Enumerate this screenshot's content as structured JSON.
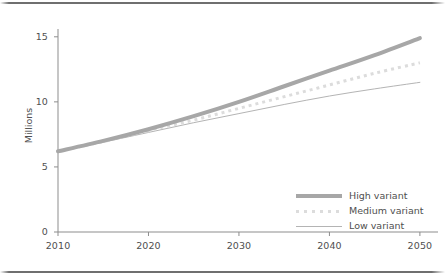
{
  "figure": {
    "background_color": "#ffffff",
    "rule_color": "#6f6f6f",
    "top_rule_name": "top-divider",
    "bottom_rule_name": "bottom-divider"
  },
  "chart_data": {
    "type": "line",
    "title": "",
    "subtitle": "",
    "xlabel": "",
    "ylabel": "Millions",
    "xlim": [
      2010,
      2052
    ],
    "ylim": [
      0,
      15.6
    ],
    "xticks": [
      2010,
      2020,
      2030,
      2040,
      2050
    ],
    "xtick_labels": [
      "2010",
      "2020",
      "2030",
      "2040",
      "2050"
    ],
    "yticks": [
      0,
      5,
      10,
      15
    ],
    "ytick_labels": [
      "0",
      "5",
      "10",
      "15"
    ],
    "grid": false,
    "legend_position": "lower right",
    "x": [
      2010,
      2015,
      2020,
      2025,
      2030,
      2035,
      2040,
      2045,
      2050
    ],
    "series": [
      {
        "name": "High variant",
        "color": "#a7a7a7",
        "style": "solid",
        "width": 4,
        "values": [
          6.2,
          7.0,
          7.9,
          8.9,
          10.0,
          11.2,
          12.4,
          13.6,
          14.9
        ]
      },
      {
        "name": "Medium variant",
        "color": "#dcdcdc",
        "style": "dotted",
        "width": 3,
        "values": [
          6.2,
          6.95,
          7.8,
          8.6,
          9.5,
          10.4,
          11.3,
          12.2,
          13.0
        ]
      },
      {
        "name": "Low variant",
        "color": "#b4b4b4",
        "style": "solid",
        "width": 1,
        "values": [
          6.2,
          6.9,
          7.65,
          8.4,
          9.1,
          9.8,
          10.45,
          11.0,
          11.5
        ]
      }
    ]
  },
  "legend": {
    "items": [
      {
        "label": "High variant",
        "swatch": "thick-solid-line-swatch"
      },
      {
        "label": "Medium variant",
        "swatch": "dotted-line-swatch"
      },
      {
        "label": "Low variant",
        "swatch": "thin-solid-line-swatch"
      }
    ]
  }
}
